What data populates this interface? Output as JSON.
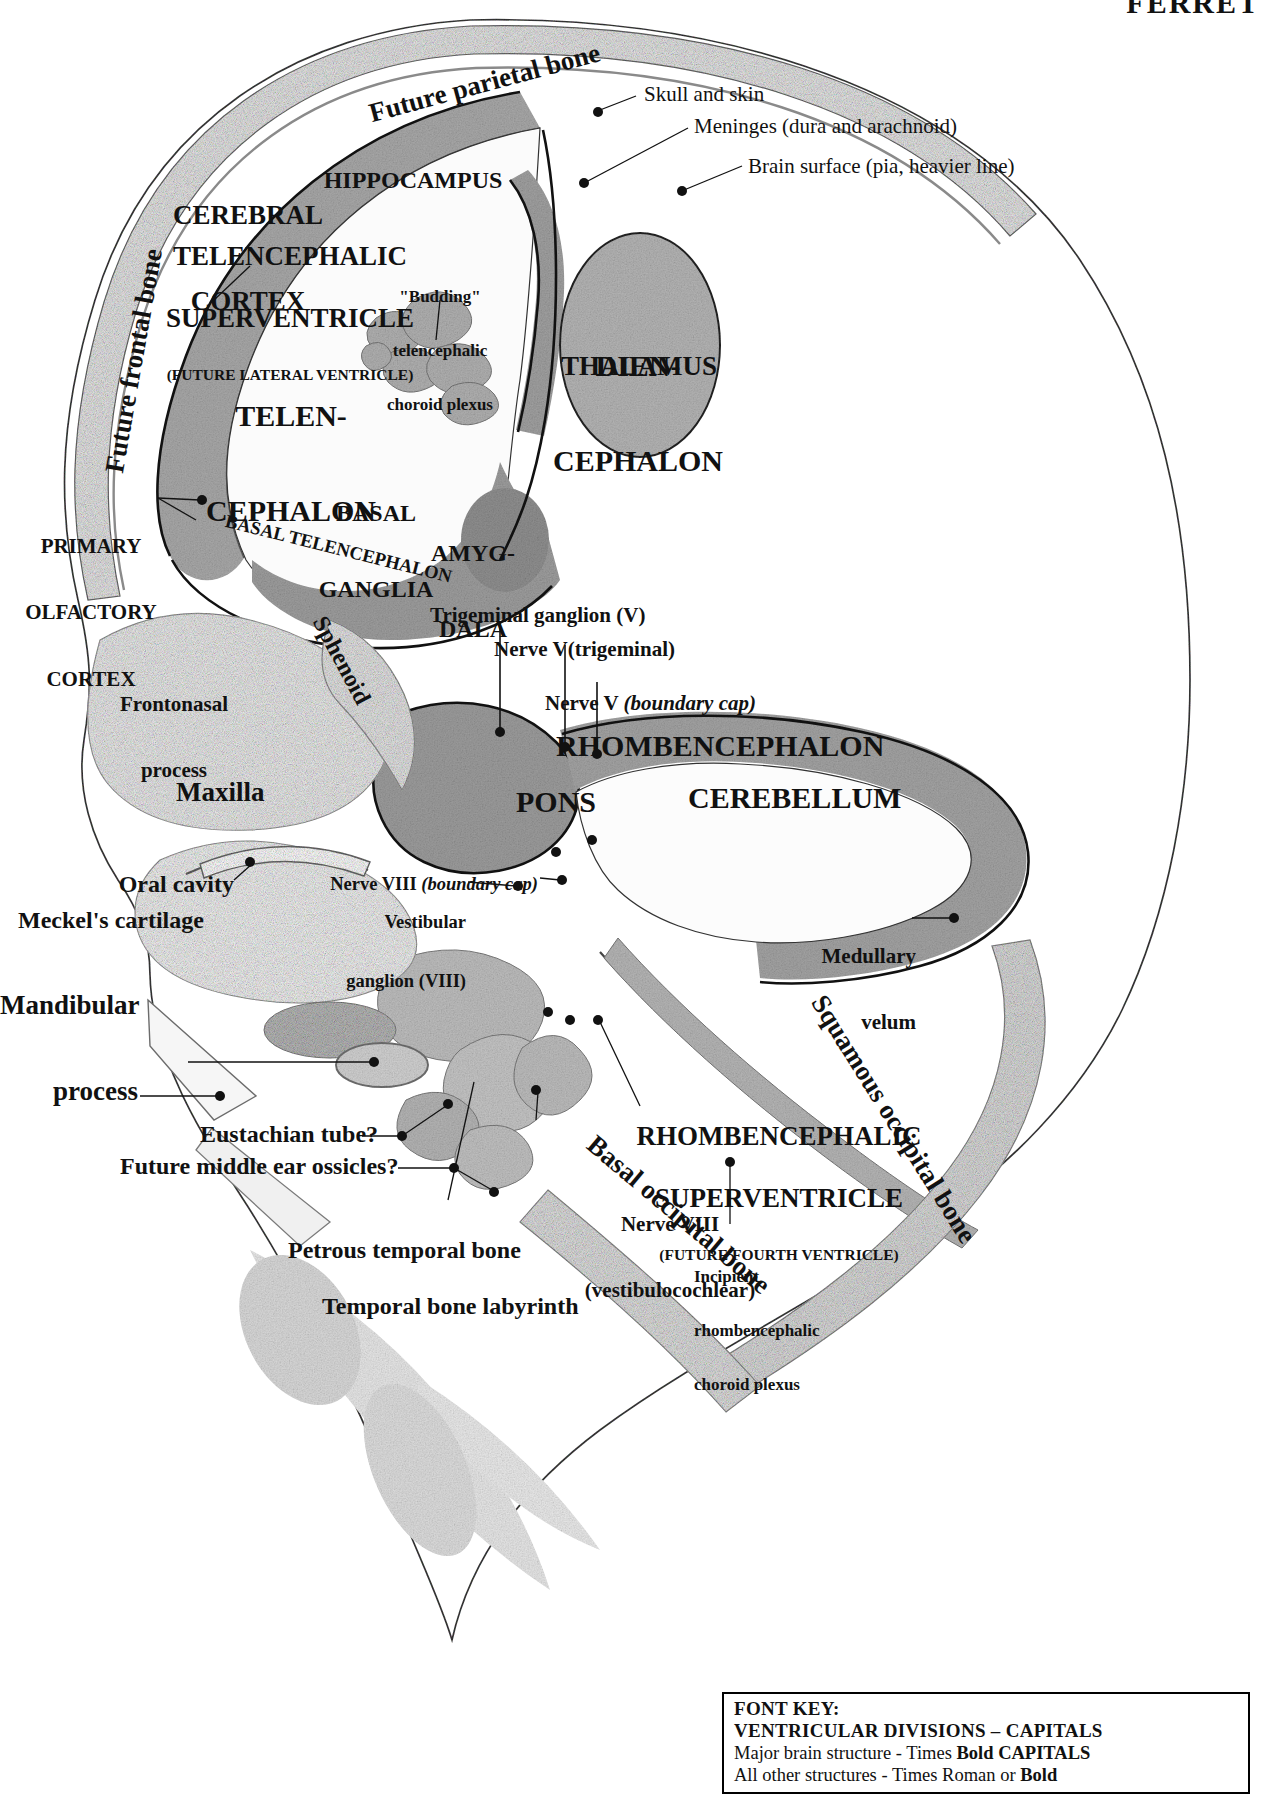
{
  "header": {
    "partial_title": "FERRET"
  },
  "figure": {
    "kind": "histological-section"
  },
  "labels": {
    "future_parietal_bone": "Future parietal bone",
    "future_frontal_bone": "Future frontal bone",
    "skull_and_skin": "Skull and skin",
    "meninges": "Meninges (dura and arachnoid)",
    "brain_surface": "Brain surface (pia, heavier line)",
    "cerebral_cortex_1": "CEREBRAL",
    "cerebral_cortex_2": "CORTEX",
    "hippocampus": "HIPPOCAMPUS",
    "telencephalic_superventricle_1": "TELENCEPHALIC",
    "telencephalic_superventricle_2": "SUPERVENTRICLE",
    "telencephalic_superventricle_3": "(FUTURE LATERAL VENTRICLE)",
    "budding_plexus_1": "\"Budding\"",
    "budding_plexus_2": "telencephalic",
    "budding_plexus_3": "choroid plexus",
    "telencephalon_1": "TELEN-",
    "telencephalon_2": "CEPHALON",
    "diencephalon_1": "DIEN-",
    "diencephalon_2": "CEPHALON",
    "thalamus": "THALAMUS",
    "basal_ganglia_1": "BASAL",
    "basal_ganglia_2": "GANGLIA",
    "amygdala_1": "AMYG-",
    "amygdala_2": "DALA",
    "primary_olfactory_cortex_1": "PRIMARY",
    "primary_olfactory_cortex_2": "OLFACTORY",
    "primary_olfactory_cortex_3": "CORTEX",
    "basal_telencephalon": "BASAL TELENCEPHALON",
    "sphenoid": "Sphenoid",
    "frontonasal_process_1": "Frontonasal",
    "frontonasal_process_2": "process",
    "maxilla": "Maxilla",
    "trigeminal_ganglion": "Trigeminal ganglion (V)",
    "nerve_v_trigeminal": "Nerve V(trigeminal)",
    "nerve_v_boundary_cap_plain": "Nerve V ",
    "nerve_v_boundary_cap_ital": "(boundary cap)",
    "rhombencephalon": "RHOMBENCEPHALON",
    "pons": "PONS",
    "cerebellum": "CEREBELLUM",
    "nerve_viii_boundary_plain": "Nerve VIII ",
    "nerve_viii_boundary_ital": "(boundary cap)",
    "vestibular_ganglion_1": "Vestibular",
    "vestibular_ganglion_2": "ganglion (VIII)",
    "oral_cavity": "Oral cavity",
    "meckels_cartilage": "Meckel's cartilage",
    "mandibular_process_1": "Mandibular",
    "mandibular_process_2": "process",
    "eustachian_tube": "Eustachian tube?",
    "future_middle_ear_ossicles": "Future middle ear ossicles?",
    "petrous_temporal_bone": "Petrous temporal bone",
    "temporal_bone_labyrinth": "Temporal bone labyrinth",
    "nerve_viii_vestibulocochlear_1": "Nerve VIII",
    "nerve_viii_vestibulocochlear_2": "(vestibulocochlear)",
    "rhombencephalic_superventricle_1": "RHOMBENCEPHALIC",
    "rhombencephalic_superventricle_2": "SUPERVENTRICLE",
    "rhombencephalic_superventricle_3": "(FUTURE FOURTH VENTRICLE)",
    "incipient_plexus_1": "Incipient",
    "incipient_plexus_2": "rhombencephalic",
    "incipient_plexus_3": "choroid plexus",
    "medullary_velum_1": "Medullary",
    "medullary_velum_2": "velum",
    "squamous_occipital_bone": "Squamous occipital bone",
    "basal_occipital_bone": "Basal occipital bone"
  },
  "font_key": {
    "title": "FONT KEY:",
    "line1": "VENTRICULAR DIVISIONS – CAPITALS",
    "line2_plain": "Major brain structure - Times ",
    "line2_bold": "Bold CAPITALS",
    "line3_plain": "All other structures - Times Roman or ",
    "line3_bold": "Bold"
  },
  "colors": {
    "ink": "#111111",
    "tissue_light": "#efefef",
    "tissue_mid": "#c9c9c9",
    "tissue_dark": "#9a9a9a",
    "outline": "#3a3a3a",
    "page_background": "#ffffff"
  }
}
